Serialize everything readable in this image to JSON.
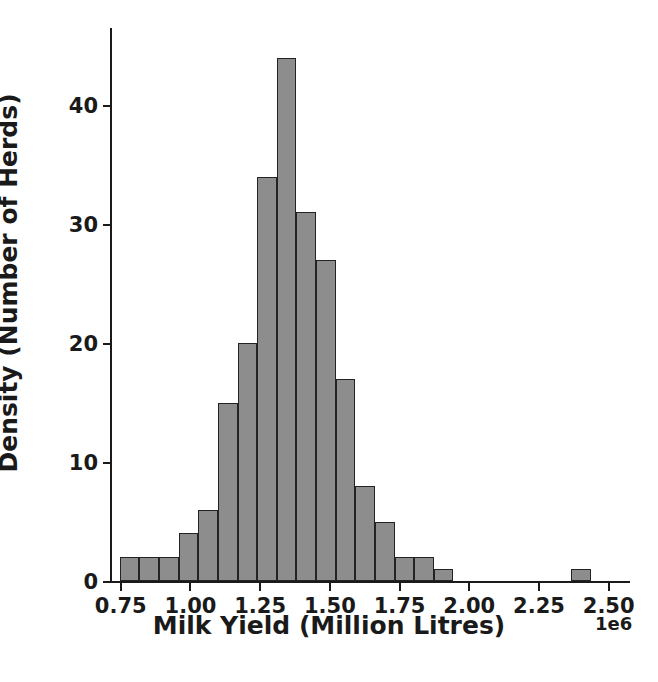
{
  "chart_data": {
    "type": "bar",
    "title": "",
    "subtitle": "",
    "xlabel": "Milk Yield (Million Litres)",
    "ylabel": "Density (Number of Herds)",
    "x_offset_text": "1e6",
    "xlim": [
      0.715,
      2.58
    ],
    "ylim": [
      0,
      46.5
    ],
    "xticks": [
      0.75,
      1.0,
      1.25,
      1.5,
      1.75,
      2.0,
      2.25,
      2.5
    ],
    "xtick_labels": [
      "0.75",
      "1.00",
      "1.25",
      "1.50",
      "1.75",
      "2.00",
      "2.25",
      "2.50"
    ],
    "yticks": [
      0,
      10,
      20,
      30,
      40
    ],
    "ytick_labels": [
      "0",
      "10",
      "20",
      "30",
      "40"
    ],
    "grid": false,
    "legend": null,
    "bar_fill_color": "#8d8d8d",
    "bar_edge_color": "#232323",
    "bin_width": 0.0704,
    "bin_edges": [
      0.75,
      0.8204,
      0.8908,
      0.9612,
      1.0316,
      1.102,
      1.1724,
      1.2428,
      1.3132,
      1.3836,
      1.454,
      1.5244,
      1.5948,
      1.6652,
      1.7356,
      1.806,
      1.8764,
      1.9468,
      2.0172,
      2.0876,
      2.158,
      2.2284,
      2.2988,
      2.3692,
      2.4396,
      2.51
    ],
    "bin_centers": [
      0.7852,
      0.8556,
      0.926,
      0.9964,
      1.0668,
      1.1372,
      1.2076,
      1.278,
      1.3484,
      1.4188,
      1.4892,
      1.5596,
      1.63,
      1.7004,
      1.7708,
      1.8412,
      1.9116,
      1.982,
      2.0524,
      2.1228,
      2.1932,
      2.2636,
      2.334,
      2.4044,
      2.4748
    ],
    "values": [
      2,
      2,
      2,
      4,
      6,
      15,
      20,
      34,
      44,
      31,
      27,
      17,
      8,
      5,
      2,
      2,
      1,
      0,
      0,
      0,
      0,
      0,
      0,
      1,
      0
    ],
    "units_note": "x values are in units of 1e6 litres"
  }
}
